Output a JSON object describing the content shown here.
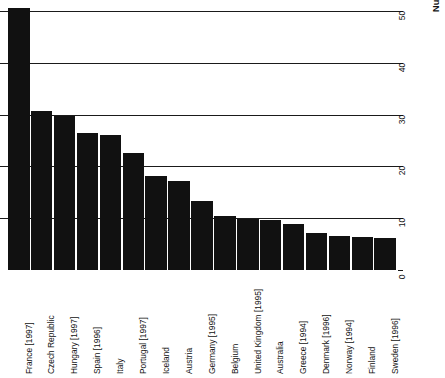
{
  "chart_data": {
    "type": "bar",
    "title": "",
    "subtitle": "",
    "orientation": "vertical-bars-with-rotated-labels",
    "xlabel": "",
    "ylabel": "Number of prescription items per capita",
    "ylim": [
      0,
      50
    ],
    "yticks": [
      0,
      10,
      20,
      30,
      40,
      50
    ],
    "ytick_labels": [
      "0",
      "10",
      "20",
      "30",
      "40",
      "50"
    ],
    "grid": "horizontal-gridlines-at-10-20-30-40-50",
    "legend": "none",
    "axis_position": "right",
    "bar_color": "#111111",
    "categories": [
      "France [1997]",
      "Czech Republic",
      "Hungary [1997]",
      "Spain [1996]",
      "Italy",
      "Portugal [1997]",
      "Iceland",
      "Austria",
      "Germany [1995]",
      "Belgium",
      "United Kingdom [1995]",
      "Australia",
      "Greece [1994]",
      "Denmark [1996]",
      "Norway [1994]",
      "Finland",
      "Sweden [1996]"
    ],
    "values": [
      50.5,
      30.7,
      29.8,
      26.5,
      26.0,
      22.5,
      18.2,
      17.2,
      13.3,
      10.5,
      9.9,
      9.6,
      8.8,
      7.2,
      6.6,
      6.3,
      6.2
    ]
  }
}
